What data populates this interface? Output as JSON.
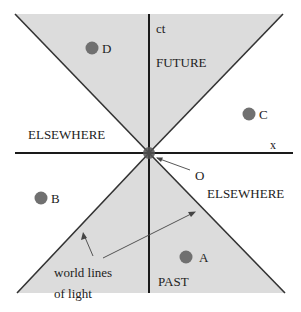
{
  "axes": {
    "time_label": "ct",
    "space_label": "x"
  },
  "regions": {
    "future": "FUTURE",
    "past": "PAST",
    "elsewhere_left": "ELSEWHERE",
    "elsewhere_right": "ELSEWHERE"
  },
  "origin": {
    "label": "O"
  },
  "events": [
    {
      "label": "D",
      "x": 92,
      "y": 48
    },
    {
      "label": "C",
      "x": 249,
      "y": 114
    },
    {
      "label": "B",
      "x": 41,
      "y": 198
    },
    {
      "label": "A",
      "x": 186,
      "y": 257
    }
  ],
  "annotation": {
    "line1": "world lines",
    "line2": "of light"
  },
  "colors": {
    "cone_fill": "#dcdcdc",
    "axis": "#1a1a1a",
    "event_dot": "#707070",
    "origin_dot": "#555555"
  }
}
